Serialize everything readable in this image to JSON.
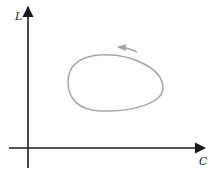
{
  "diagram": {
    "type": "phase-plane-loop",
    "axes": {
      "y_label": "L",
      "x_label": "C",
      "axis_color": "#1a1a1a"
    },
    "loop": {
      "shape": "closed-egg-curve",
      "direction": "counterclockwise",
      "stroke_color": "#a6a6a6"
    },
    "arrow": {
      "direction": "left",
      "color": "#a6a6a6"
    }
  }
}
